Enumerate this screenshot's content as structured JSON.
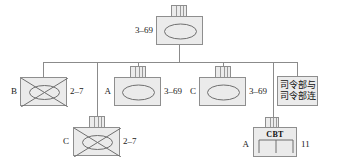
{
  "diagram": {
    "colors": {
      "box_fill": "#ebebeb",
      "box_border": "#8e8e8e",
      "line": "#8b8b8b",
      "symbol_stroke": "#6f6f6f",
      "text": "#111111"
    }
  },
  "units": {
    "root": {
      "designation_left": "",
      "designation_right": "3–69",
      "label_right": "3–69",
      "symbol": "armor-ellipse",
      "has_hq_tab": true
    },
    "b_company": {
      "label_left": "B",
      "label_right": "2–7",
      "symbol": "mechanized-infantry",
      "has_hq_tab": false
    },
    "a_company": {
      "label_left": "A",
      "label_right": "3–69",
      "symbol": "armor-ellipse",
      "has_hq_tab": true
    },
    "c_company": {
      "label_left": "C",
      "label_right": "3–69",
      "symbol": "armor-ellipse",
      "has_hq_tab": true
    },
    "hhc_textbox": {
      "line1": "司令部与",
      "line2": "司令部连"
    },
    "c_company_mech": {
      "label_left": "C",
      "label_right": "2–7",
      "symbol": "mechanized-infantry",
      "has_hq_tab": true
    },
    "engineer_company": {
      "label_left": "A",
      "label_right": "11",
      "inner_text": "CBT",
      "symbol": "engineer-bridge",
      "has_hq_tab": true
    }
  }
}
